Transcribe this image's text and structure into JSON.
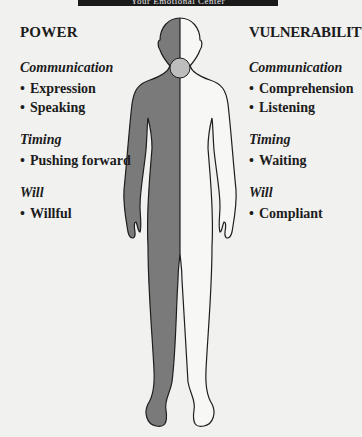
{
  "banner": {
    "title": "Your Emotional Center"
  },
  "colors": {
    "background": "#f1f1f0",
    "power_fill": "#7a7a7a",
    "vulnerability_fill": "#f7f7f6",
    "outline": "#1e1e1e",
    "banner": "#1a1a1a"
  },
  "power": {
    "heading": "POWER",
    "groups": [
      {
        "category": "Communication",
        "items": [
          "Expression",
          "Speaking"
        ]
      },
      {
        "category": "Timing",
        "items": [
          "Pushing forward"
        ]
      },
      {
        "category": "Will",
        "items": [
          "Willful"
        ]
      }
    ]
  },
  "vulnerability": {
    "heading": "VULNERABILITY",
    "groups": [
      {
        "category": "Communication",
        "items": [
          "Comprehension",
          "Listening"
        ]
      },
      {
        "category": "Timing",
        "items": [
          "Waiting"
        ]
      },
      {
        "category": "Will",
        "items": [
          "Compliant"
        ]
      }
    ]
  },
  "figure": {
    "left_half": "power (shaded)",
    "right_half": "vulnerability (unshaded)",
    "throat_center": "circle at throat"
  },
  "bullet_glyph": "•"
}
